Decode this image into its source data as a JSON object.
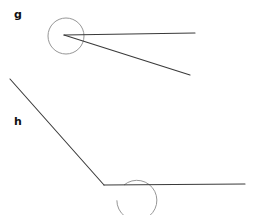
{
  "figure": {
    "background_color": "#ffffff",
    "width": 254,
    "height": 215,
    "line_color": "#3a3a3a",
    "arc_color": "#8a8a8a",
    "label_color": "#111111"
  },
  "labels": {
    "g": "g",
    "h": "h"
  },
  "chart_data": {
    "type": "diagram",
    "shapes": [
      {
        "name": "angle-g",
        "label": "g",
        "label_position": {
          "x": 14,
          "y": 9
        },
        "vertex": {
          "x": 64,
          "y": 35
        },
        "marking": {
          "kind": "full-circle",
          "center": {
            "x": 66,
            "y": 36
          },
          "radius": 18,
          "sweep_degrees": 360
        },
        "rays": [
          {
            "name": "ray-g-horizontal",
            "from": {
              "x": 64,
              "y": 35
            },
            "to": {
              "x": 195,
              "y": 33
            }
          },
          {
            "name": "ray-g-descending",
            "from": {
              "x": 64,
              "y": 35
            },
            "to": {
              "x": 190,
              "y": 75
            }
          }
        ],
        "angle_degrees": 18
      },
      {
        "name": "angle-h",
        "label": "h",
        "label_position": {
          "x": 14,
          "y": 116
        },
        "vertex": {
          "x": 104,
          "y": 185
        },
        "marking": {
          "kind": "reflex-arc",
          "center": {
            "x": 104,
            "y": 185
          },
          "radius": 20,
          "start_degrees": 0,
          "sweep_degrees": 310
        },
        "rays": [
          {
            "name": "ray-h-horizontal",
            "from": {
              "x": 104,
              "y": 185
            },
            "to": {
              "x": 245,
              "y": 184
            }
          },
          {
            "name": "ray-h-upleft",
            "from": {
              "x": 104,
              "y": 185
            },
            "to": {
              "x": 10,
              "y": 79
            }
          }
        ],
        "angle_degrees": 312
      }
    ]
  }
}
